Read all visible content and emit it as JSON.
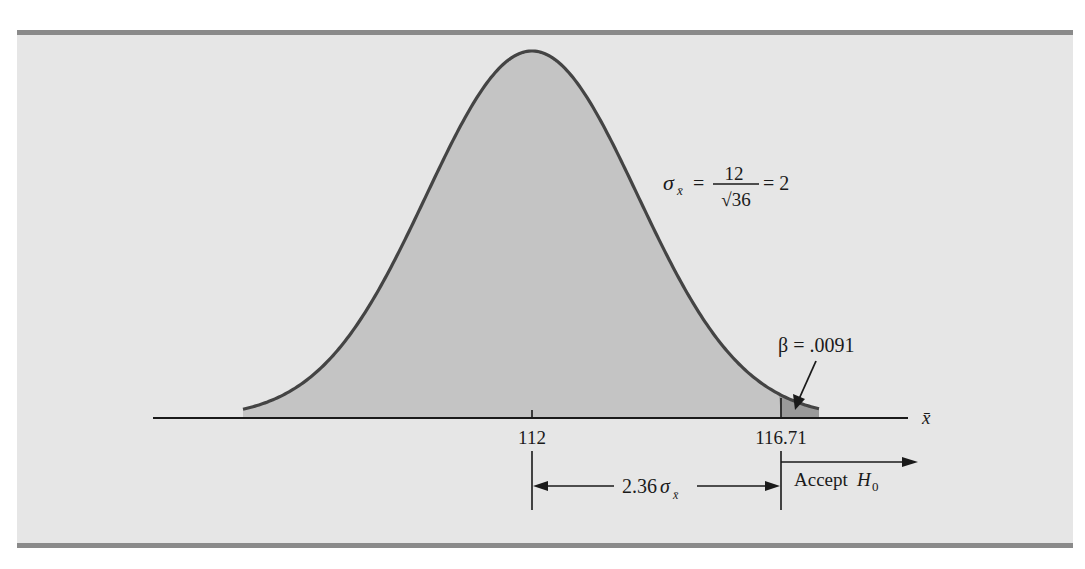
{
  "figure": {
    "background_color": "#e6e6e6",
    "rule_color": "#8a8a8a",
    "curve_color": "#444444",
    "fill_color": "#c4c4c4",
    "tail_fill_color": "#9a9a9a"
  },
  "labels": {
    "sigma_lhs": "σ",
    "sigma_sub": "x̄",
    "equals1": "=",
    "numerator": "12",
    "denominator": "√36",
    "equals2": "= 2",
    "beta": "β = .0091",
    "tick_mean": "112",
    "tick_critical": "116.71",
    "axis_label": "x̄",
    "distance_value": "2.36",
    "distance_sigma": "σ",
    "distance_sub": "x̄",
    "accept_text": "Accept ",
    "accept_h": "H",
    "accept_sub": "0"
  },
  "chart_data": {
    "type": "area",
    "title": "",
    "distribution": "normal",
    "mean": 112,
    "std_error": 2,
    "std_error_formula": "σ_x̄ = 12/√36 = 2",
    "critical_value": 116.71,
    "distance_from_mean": "2.36σ_x̄",
    "beta": 0.0091,
    "shaded_regions": [
      {
        "from": "left tail",
        "to": 116.71,
        "meaning": "sampling distribution"
      },
      {
        "from": 116.71,
        "to": "right tail",
        "meaning": "β = .0091 (Accept H0)"
      }
    ],
    "xlabel": "x̄",
    "ylabel": "",
    "x_ticks": [
      112,
      116.71
    ],
    "annotations": [
      "σ_x̄ = 12/√36 = 2",
      "β = .0091",
      "2.36σ_x̄",
      "Accept H0"
    ]
  }
}
